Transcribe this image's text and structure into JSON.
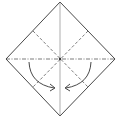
{
  "diagram": {
    "title": "Origami fold step: square base",
    "type": "origami-fold-diagram",
    "colors": {
      "outline": "#333333",
      "crease": "#555555",
      "arrow": "#333333",
      "background": "#ffffff"
    },
    "elements": [
      {
        "name": "square-outline",
        "kind": "diamond",
        "points": [
          [
            60,
            2
          ],
          [
            115,
            59
          ],
          [
            60,
            116
          ],
          [
            6,
            59
          ]
        ]
      },
      {
        "name": "vertical-crease",
        "kind": "solid-line",
        "from": [
          60,
          2
        ],
        "to": [
          60,
          116
        ]
      },
      {
        "name": "horizontal-mountain-fold",
        "kind": "dash-dot-line",
        "from": [
          6,
          59
        ],
        "to": [
          115,
          59
        ]
      },
      {
        "name": "diagonal-valley-fold-1",
        "kind": "dashed-line",
        "from": [
          33,
          31
        ],
        "to": [
          88,
          87
        ]
      },
      {
        "name": "diagonal-valley-fold-2",
        "kind": "dashed-line",
        "from": [
          88,
          31
        ],
        "to": [
          33,
          87
        ]
      },
      {
        "name": "fold-arrow-left",
        "kind": "curved-arrow",
        "direction": "inward"
      },
      {
        "name": "fold-arrow-right",
        "kind": "curved-arrow",
        "direction": "inward"
      }
    ]
  }
}
